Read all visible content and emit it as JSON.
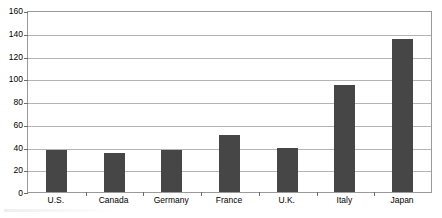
{
  "chart_data": {
    "type": "bar",
    "title": "",
    "subtitle": "",
    "xlabel": "",
    "ylabel": "",
    "categories": [
      "U.S.",
      "Canada",
      "Germany",
      "France",
      "U.K.",
      "Italy",
      "Japan"
    ],
    "values": [
      37,
      35,
      37,
      51,
      39,
      95,
      136
    ],
    "series": [
      {
        "name": "",
        "values": [
          37,
          35,
          37,
          51,
          39,
          95,
          136
        ]
      }
    ],
    "ylim": [
      0,
      160
    ],
    "ytick_step": 20,
    "ytick_labels": [
      "0",
      "20",
      "40",
      "60",
      "80",
      "100",
      "120",
      "140",
      "160"
    ],
    "ytick_values": [
      0,
      20,
      40,
      60,
      80,
      100,
      120,
      140,
      160
    ],
    "grid": true,
    "grid_axis": "y",
    "legend": false,
    "legend_position": "none",
    "annotations": [],
    "colors": {
      "bar_fill": "#464646",
      "gridline": "#b4b4b4",
      "axis_line": "#9a9a9a",
      "tick_mark": "#6a6a6a",
      "background": "#ffffff",
      "text": "#000000"
    }
  }
}
